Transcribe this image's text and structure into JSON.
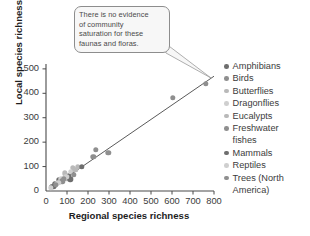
{
  "callout": {
    "text": "There is no evidence\nof community\nsaturation for these\nfaunas and floras."
  },
  "chart_data": {
    "type": "scatter",
    "title": "",
    "xlabel": "Regional species richness",
    "ylabel": "Local species richness",
    "xlim": [
      0,
      800
    ],
    "ylim": [
      0,
      520
    ],
    "xticks": [
      "0",
      "100",
      "200",
      "300",
      "400",
      "500",
      "600",
      "700",
      "800"
    ],
    "yticks": [
      "0",
      "100",
      "200",
      "300",
      "400",
      "500"
    ],
    "grid": false,
    "legend_position": "right",
    "trendline": {
      "x0": 20,
      "y0": 10,
      "x1": 800,
      "y1": 470
    },
    "colors": {
      "dark": "#6e6e6e",
      "mid": "#8f8f8f",
      "light": "#b9b9b9",
      "pale": "#cfcfcf",
      "line": "#5a5a5a",
      "axis": "#4a4a4a"
    },
    "series": [
      {
        "name": "Amphibians",
        "shade": "dark",
        "points": [
          [
            28,
            18
          ],
          [
            45,
            30
          ],
          [
            62,
            44
          ],
          [
            108,
            62
          ]
        ]
      },
      {
        "name": "Birds",
        "shade": "mid",
        "points": [
          [
            238,
            168
          ],
          [
            296,
            156
          ],
          [
            605,
            382
          ],
          [
            760,
            440
          ]
        ]
      },
      {
        "name": "Butterflies",
        "shade": "light",
        "points": [
          [
            90,
            72
          ],
          [
            128,
            96
          ],
          [
            152,
            100
          ]
        ]
      },
      {
        "name": "Dragonflies",
        "shade": "pale",
        "points": [
          [
            52,
            30
          ],
          [
            72,
            48
          ],
          [
            118,
            78
          ]
        ]
      },
      {
        "name": "Eucalypts",
        "shade": "light",
        "points": [
          [
            40,
            22
          ],
          [
            100,
            52
          ],
          [
            140,
            88
          ]
        ]
      },
      {
        "name": "Freshwater fishes",
        "shade": "mid",
        "points": [
          [
            30,
            16
          ],
          [
            78,
            40
          ],
          [
            226,
            140
          ]
        ]
      },
      {
        "name": "Mammals",
        "shade": "dark",
        "points": [
          [
            36,
            20
          ],
          [
            115,
            48
          ],
          [
            170,
            100
          ]
        ]
      },
      {
        "name": "Reptiles",
        "shade": "pale",
        "points": [
          [
            24,
            12
          ],
          [
            58,
            34
          ],
          [
            96,
            58
          ]
        ]
      },
      {
        "name": "Trees (North America)",
        "shade": "mid",
        "points": [
          [
            48,
            26
          ],
          [
            86,
            50
          ],
          [
            132,
            66
          ]
        ]
      }
    ]
  },
  "legend": {
    "items": [
      {
        "label": "Amphibians",
        "shade": "dark"
      },
      {
        "label": "Birds",
        "shade": "mid"
      },
      {
        "label": "Butterflies",
        "shade": "light"
      },
      {
        "label": "Dragonflies",
        "shade": "pale"
      },
      {
        "label": "Eucalypts",
        "shade": "light"
      },
      {
        "label": "Freshwater",
        "shade": "mid",
        "cont": "fishes"
      },
      {
        "label": "Mammals",
        "shade": "dark"
      },
      {
        "label": "Reptiles",
        "shade": "pale"
      },
      {
        "label": "Trees (North",
        "shade": "mid",
        "cont": "America)"
      }
    ]
  }
}
